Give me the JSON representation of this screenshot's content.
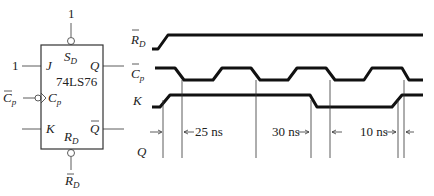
{
  "circuit": {
    "chip_label": "74LS76",
    "pins": {
      "sd": {
        "label": "S",
        "sub": "D",
        "tie": "1"
      },
      "j": {
        "label": "J",
        "tie": "1"
      },
      "q": {
        "label": "Q"
      },
      "cp": {
        "label": "C",
        "sub": "p",
        "input_label": "C",
        "input_sub": "p"
      },
      "k": {
        "label": "K"
      },
      "qbar": {
        "label": "Q"
      },
      "rd": {
        "label": "R",
        "sub": "D",
        "input_label": "R",
        "input_sub": "D"
      }
    }
  },
  "timing": {
    "signals": [
      {
        "name": "RD_bar",
        "label": "R",
        "sub": "D"
      },
      {
        "name": "Cp_bar",
        "label": "C",
        "sub": "p"
      },
      {
        "name": "K",
        "label": "K"
      },
      {
        "name": "Q",
        "label": "Q"
      }
    ],
    "annotations": {
      "delay1": "25 ns",
      "delay2": "30 ns",
      "delay3": "10 ns"
    }
  }
}
